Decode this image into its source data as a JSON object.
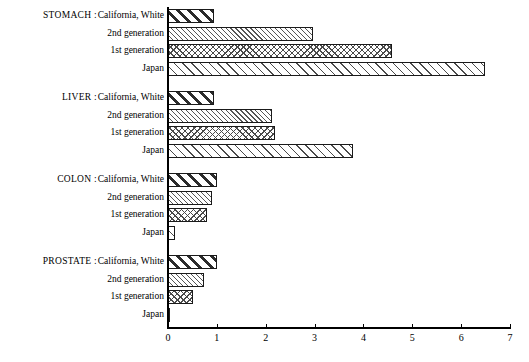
{
  "chart_data": {
    "type": "bar",
    "orientation": "horizontal",
    "title": "",
    "xlabel": "",
    "ylabel": "",
    "xlim": [
      0,
      7
    ],
    "xticks": [
      0,
      1,
      2,
      3,
      4,
      5,
      6,
      7
    ],
    "xtick_labels": [
      "0",
      "1",
      "2",
      "3",
      "4",
      "5",
      "6",
      "7"
    ],
    "grid": false,
    "legend": "none",
    "categories": [
      "California, White",
      "2nd generation",
      "1st generation",
      "Japan"
    ],
    "groups": [
      {
        "name": "STOMACH :",
        "values": [
          0.95,
          2.97,
          4.58,
          6.49
        ]
      },
      {
        "name": "LIVER :",
        "values": [
          0.95,
          2.13,
          2.19,
          3.79
        ]
      },
      {
        "name": "COLON :",
        "values": [
          1.0,
          0.9,
          0.8,
          0.14
        ]
      },
      {
        "name": "PROSTATE :",
        "values": [
          1.0,
          0.73,
          0.51,
          0.05
        ]
      }
    ],
    "patterns": {
      "California, White": "bold-diagonal-hatch",
      "2nd generation": "fine-diagonal-hatch",
      "1st generation": "cross-hatch",
      "Japan": "medium-diagonal-hatch"
    },
    "colors": {
      "axis": "#000000",
      "bar_outline": "#1a1a1a",
      "bar_fill": "#ffffff",
      "background": "#ffffff"
    }
  },
  "axis": {
    "ticks": [
      "0",
      "1",
      "2",
      "3",
      "4",
      "5",
      "6",
      "7"
    ]
  },
  "groups": [
    {
      "label": "STOMACH :",
      "rows": [
        {
          "label": "California, White",
          "value": 0.95
        },
        {
          "label": "2nd generation",
          "value": 2.97
        },
        {
          "label": "1st generation",
          "value": 4.58
        },
        {
          "label": "Japan",
          "value": 6.49
        }
      ]
    },
    {
      "label": "LIVER :",
      "rows": [
        {
          "label": "California, White",
          "value": 0.95
        },
        {
          "label": "2nd generation",
          "value": 2.13
        },
        {
          "label": "1st generation",
          "value": 2.19
        },
        {
          "label": "Japan",
          "value": 3.79
        }
      ]
    },
    {
      "label": "COLON :",
      "rows": [
        {
          "label": "California, White",
          "value": 1.0
        },
        {
          "label": "2nd generation",
          "value": 0.9
        },
        {
          "label": "1st generation",
          "value": 0.8
        },
        {
          "label": "Japan",
          "value": 0.14
        }
      ]
    },
    {
      "label": "PROSTATE :",
      "rows": [
        {
          "label": "California, White",
          "value": 1.0
        },
        {
          "label": "2nd generation",
          "value": 0.73
        },
        {
          "label": "1st generation",
          "value": 0.51
        },
        {
          "label": "Japan",
          "value": 0.05
        }
      ]
    }
  ],
  "layout": {
    "origin_x": 168,
    "px_per_unit": 48.86,
    "bar_height": 14,
    "row_pitch": 17.5,
    "group_gap": 12,
    "first_row_top": 9,
    "axis_y": 327,
    "group_label_right": 97,
    "cat_label_right": 164
  }
}
